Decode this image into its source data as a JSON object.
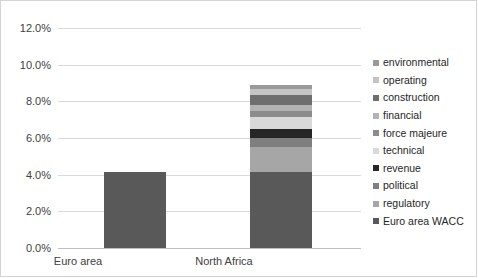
{
  "chart_data": {
    "type": "bar",
    "subtype": "stacked-column",
    "title": "",
    "xlabel": "",
    "ylabel": "",
    "categories": [
      "Euro area",
      "North Africa"
    ],
    "ylim": [
      0.0,
      12.0
    ],
    "ytick_labels": [
      "0.0%",
      "2.0%",
      "4.0%",
      "6.0%",
      "8.0%",
      "10.0%",
      "12.0%"
    ],
    "ytick_values": [
      0.0,
      2.0,
      4.0,
      6.0,
      8.0,
      10.0,
      12.0
    ],
    "grid": "horizontal",
    "legend_position": "right",
    "legend_order_top_to_bottom": [
      "environmental",
      "operating",
      "construction",
      "financial",
      "force majeure",
      "technical",
      "revenue",
      "political",
      "regulatory",
      "Euro area WACC"
    ],
    "units": "percent",
    "series": [
      {
        "name": "Euro area WACC",
        "color": "#595959",
        "values": [
          4.15,
          4.15
        ]
      },
      {
        "name": "regulatory",
        "color": "#a6a6a6",
        "values": [
          0,
          1.35
        ]
      },
      {
        "name": "political",
        "color": "#7f7f7f",
        "values": [
          0,
          0.5
        ]
      },
      {
        "name": "revenue",
        "color": "#262626",
        "values": [
          0,
          0.5
        ]
      },
      {
        "name": "technical",
        "color": "#d9d9d9",
        "values": [
          0,
          0.65
        ]
      },
      {
        "name": "force majeure",
        "color": "#8c8c8c",
        "values": [
          0,
          0.35
        ]
      },
      {
        "name": "financial",
        "color": "#b3b3b3",
        "values": [
          0,
          0.3
        ]
      },
      {
        "name": "construction",
        "color": "#6e6e6e",
        "values": [
          0,
          0.55
        ]
      },
      {
        "name": "operating",
        "color": "#c4c4c4",
        "values": [
          0,
          0.3
        ]
      },
      {
        "name": "environmental",
        "color": "#9a9a9a",
        "values": [
          0,
          0.25
        ]
      }
    ],
    "totals": [
      4.15,
      10.3
    ]
  },
  "legend": {
    "items": [
      {
        "label": "environmental",
        "color": "#9a9a9a"
      },
      {
        "label": "operating",
        "color": "#c4c4c4"
      },
      {
        "label": "construction",
        "color": "#6e6e6e"
      },
      {
        "label": "financial",
        "color": "#b3b3b3"
      },
      {
        "label": "force majeure",
        "color": "#8c8c8c"
      },
      {
        "label": "technical",
        "color": "#d9d9d9"
      },
      {
        "label": "revenue",
        "color": "#262626"
      },
      {
        "label": "political",
        "color": "#7f7f7f"
      },
      {
        "label": "regulatory",
        "color": "#a6a6a6"
      },
      {
        "label": "Euro area WACC",
        "color": "#595959"
      }
    ]
  },
  "axis": {
    "y_ticks": [
      "12.0%",
      "10.0%",
      "8.0%",
      "6.0%",
      "4.0%",
      "2.0%",
      "0.0%"
    ],
    "x_ticks": [
      "Euro area",
      "North Africa"
    ]
  },
  "colors": {
    "gridline": "#d9d9d9",
    "axis": "#bfbfbf",
    "border": "#d3d3d3",
    "tick_text": "#404040",
    "legend_text": "#262626"
  }
}
